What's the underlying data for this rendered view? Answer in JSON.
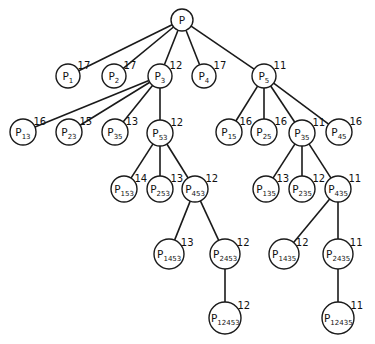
{
  "diagram": {
    "type": "tree",
    "colors": {
      "line": "#1a1a1a",
      "node_fill": "#ffffff",
      "text": "#111111"
    },
    "nodes": [
      {
        "id": "P",
        "base": "P",
        "sub": "",
        "value": "",
        "x": 182,
        "y": 20,
        "r": 11
      },
      {
        "id": "P1",
        "base": "P",
        "sub": "1",
        "value": "17",
        "x": 68,
        "y": 76,
        "r": 12
      },
      {
        "id": "P2",
        "base": "P",
        "sub": "2",
        "value": "17",
        "x": 114,
        "y": 76,
        "r": 12
      },
      {
        "id": "P3",
        "base": "P",
        "sub": "3",
        "value": "12",
        "x": 160,
        "y": 76,
        "r": 12
      },
      {
        "id": "P4",
        "base": "P",
        "sub": "4",
        "value": "17",
        "x": 204,
        "y": 76,
        "r": 12
      },
      {
        "id": "P5",
        "base": "P",
        "sub": "5",
        "value": "11",
        "x": 264,
        "y": 76,
        "r": 12
      },
      {
        "id": "P13",
        "base": "P",
        "sub": "13",
        "value": "16",
        "x": 23,
        "y": 132,
        "r": 13
      },
      {
        "id": "P23",
        "base": "P",
        "sub": "23",
        "value": "15",
        "x": 69,
        "y": 132,
        "r": 13
      },
      {
        "id": "P35a",
        "base": "P",
        "sub": "35",
        "value": "13",
        "x": 115,
        "y": 132,
        "r": 13
      },
      {
        "id": "P53",
        "base": "P",
        "sub": "53",
        "value": "12",
        "x": 160,
        "y": 133,
        "r": 13
      },
      {
        "id": "P15",
        "base": "P",
        "sub": "15",
        "value": "16",
        "x": 229,
        "y": 132,
        "r": 13
      },
      {
        "id": "P25",
        "base": "P",
        "sub": "25",
        "value": "16",
        "x": 264,
        "y": 132,
        "r": 13
      },
      {
        "id": "P35b",
        "base": "P",
        "sub": "35",
        "value": "11",
        "x": 302,
        "y": 133,
        "r": 13
      },
      {
        "id": "P45",
        "base": "P",
        "sub": "45",
        "value": "16",
        "x": 339,
        "y": 132,
        "r": 13
      },
      {
        "id": "P153",
        "base": "P",
        "sub": "153",
        "value": "14",
        "x": 124,
        "y": 189,
        "r": 13
      },
      {
        "id": "P253",
        "base": "P",
        "sub": "253",
        "value": "13",
        "x": 160,
        "y": 189,
        "r": 13
      },
      {
        "id": "P453",
        "base": "P",
        "sub": "453",
        "value": "12",
        "x": 195,
        "y": 189,
        "r": 13
      },
      {
        "id": "P135",
        "base": "P",
        "sub": "135",
        "value": "13",
        "x": 266,
        "y": 189,
        "r": 13
      },
      {
        "id": "P235",
        "base": "P",
        "sub": "235",
        "value": "12",
        "x": 302,
        "y": 189,
        "r": 13
      },
      {
        "id": "P435",
        "base": "P",
        "sub": "435",
        "value": "11",
        "x": 338,
        "y": 189,
        "r": 13
      },
      {
        "id": "P1453",
        "base": "P",
        "sub": "1453",
        "value": "13",
        "x": 169,
        "y": 254,
        "r": 15
      },
      {
        "id": "P2453",
        "base": "P",
        "sub": "2453",
        "value": "12",
        "x": 225,
        "y": 254,
        "r": 15
      },
      {
        "id": "P1435",
        "base": "P",
        "sub": "1435",
        "value": "12",
        "x": 284,
        "y": 254,
        "r": 15
      },
      {
        "id": "P2435",
        "base": "P",
        "sub": "2435",
        "value": "11",
        "x": 338,
        "y": 254,
        "r": 15
      },
      {
        "id": "P12453",
        "base": "P",
        "sub": "12453",
        "value": "12",
        "x": 225,
        "y": 318,
        "r": 16
      },
      {
        "id": "P12435",
        "base": "P",
        "sub": "12435",
        "value": "11",
        "x": 338,
        "y": 318,
        "r": 16
      }
    ],
    "edges": [
      [
        "P",
        "P1"
      ],
      [
        "P",
        "P2"
      ],
      [
        "P",
        "P3"
      ],
      [
        "P",
        "P4"
      ],
      [
        "P",
        "P5"
      ],
      [
        "P3",
        "P13"
      ],
      [
        "P3",
        "P23"
      ],
      [
        "P3",
        "P35a"
      ],
      [
        "P3",
        "P53"
      ],
      [
        "P5",
        "P15"
      ],
      [
        "P5",
        "P25"
      ],
      [
        "P5",
        "P35b"
      ],
      [
        "P5",
        "P45"
      ],
      [
        "P53",
        "P153"
      ],
      [
        "P53",
        "P253"
      ],
      [
        "P53",
        "P453"
      ],
      [
        "P35b",
        "P135"
      ],
      [
        "P35b",
        "P235"
      ],
      [
        "P35b",
        "P435"
      ],
      [
        "P453",
        "P1453"
      ],
      [
        "P453",
        "P2453"
      ],
      [
        "P435",
        "P1435"
      ],
      [
        "P435",
        "P2435"
      ],
      [
        "P2453",
        "P12453"
      ],
      [
        "P2435",
        "P12435"
      ]
    ]
  }
}
